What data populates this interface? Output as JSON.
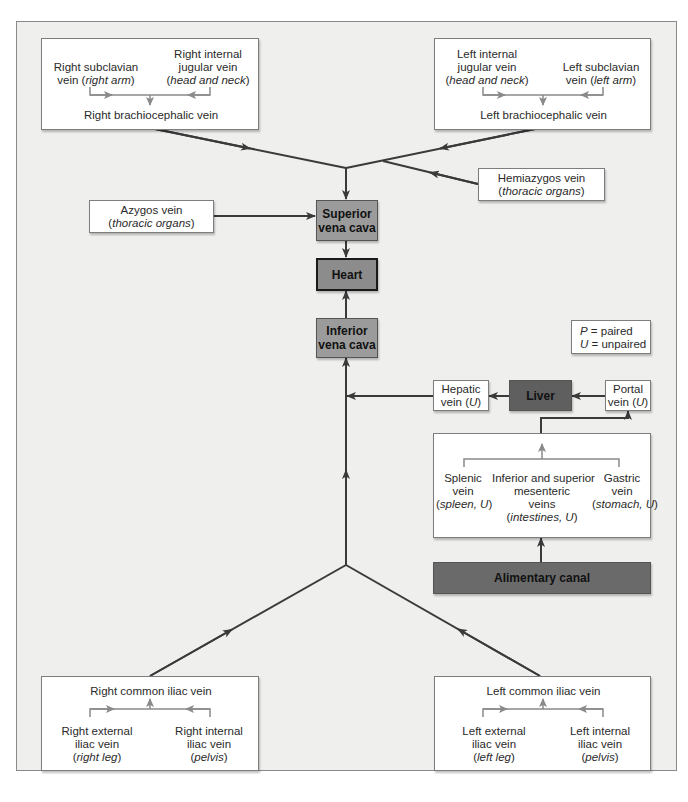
{
  "figure": {
    "legend": {
      "p_key": "P",
      "p_text": " = paired",
      "u_key": "U",
      "u_text": " = unpaired"
    },
    "colors": {
      "background": "#efefed",
      "frame_border": "#8a8a8a",
      "vena_cava_fill": "#9b9b9b",
      "heart_fill": "#8c8c8c",
      "liver_fill": "#5f5f5f",
      "alimentary_fill": "#6a6a6a",
      "main_line": "#3a3a3a",
      "inner_line": "#8a8a8a"
    },
    "right_brachiocephalic_group": {
      "left_source": {
        "name": "Right subclavian",
        "line2": "vein (",
        "region": "right arm",
        "close": ")"
      },
      "right_source": {
        "line1": "Right internal",
        "line2": "jugular vein",
        "region": "head and neck"
      },
      "result": "Right brachiocephalic vein"
    },
    "left_brachiocephalic_group": {
      "left_source": {
        "line1": "Left internal",
        "line2": "jugular vein",
        "region": "head and neck"
      },
      "right_source": {
        "name": "Left subclavian",
        "line2": "vein (",
        "region": "left arm",
        "close": ")"
      },
      "result": "Left brachiocephalic vein"
    },
    "hemiazygos": {
      "name": "Hemiazygos vein",
      "region": "thoracic organs"
    },
    "azygos": {
      "name": "Azygos vein",
      "region": "thoracic organs"
    },
    "superior_vena_cava": {
      "line1": "Superior",
      "line2": "vena cava"
    },
    "heart": {
      "label": "Heart"
    },
    "inferior_vena_cava": {
      "line1": "Inferior",
      "line2": "vena cava"
    },
    "hepatic_vein": {
      "line1": "Hepatic",
      "line2": "vein (",
      "tag": "U",
      "close": ")"
    },
    "liver": {
      "label": "Liver"
    },
    "portal_vein": {
      "line1": "Portal",
      "line2": "vein (",
      "tag": "U",
      "close": ")"
    },
    "gi_group": {
      "splenic": {
        "line1": "Splenic",
        "line2": "vein",
        "region": "spleen, U"
      },
      "mesenteric": {
        "line1": "Inferior and superior",
        "line2": "mesenteric",
        "line3": "veins",
        "region": "intestines, U"
      },
      "gastric": {
        "line1": "Gastric",
        "line2": "vein",
        "region": "stomach, U"
      }
    },
    "alimentary_canal": {
      "label": "Alimentary canal"
    },
    "right_iliac_group": {
      "result": "Right common iliac vein",
      "left_source": {
        "line1": "Right external",
        "line2": "iliac vein",
        "region": "right leg"
      },
      "right_source": {
        "line1": "Right internal",
        "line2": "iliac vein",
        "region": "pelvis"
      }
    },
    "left_iliac_group": {
      "result": "Left common iliac vein",
      "left_source": {
        "line1": "Left external",
        "line2": "iliac vein",
        "region": "left leg"
      },
      "right_source": {
        "line1": "Left internal",
        "line2": "iliac vein",
        "region": "pelvis"
      }
    }
  }
}
